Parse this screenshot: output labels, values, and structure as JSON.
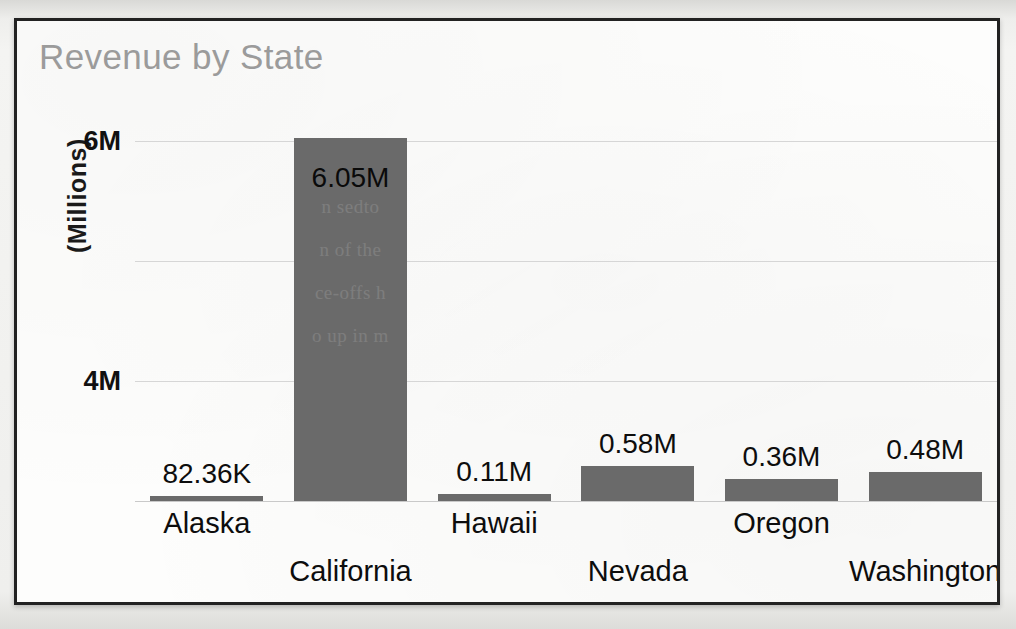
{
  "chart_data": {
    "type": "bar",
    "title": "Revenue by State",
    "xlabel": "",
    "ylabel": "(Millions)",
    "categories": [
      "Alaska",
      "California",
      "Hawaii",
      "Nevada",
      "Oregon",
      "Washington"
    ],
    "values": [
      0.08236,
      6.05,
      0.11,
      0.58,
      0.36,
      0.48
    ],
    "data_labels": [
      "82.36K",
      "6.05M",
      "0.11M",
      "0.58M",
      "0.36M",
      "0.48M"
    ],
    "ylim": [
      0,
      6
    ],
    "ytick_values": [
      0,
      2,
      4,
      6
    ],
    "ytick_labels": [
      "0M",
      "2M",
      "4M",
      "6M"
    ],
    "grid": true,
    "legend": "none",
    "series": [
      {
        "name": "Revenue",
        "values": [
          0.08236,
          6.05,
          0.11,
          0.58,
          0.36,
          0.48
        ]
      }
    ],
    "colors": {
      "bar": "#6a6a6a",
      "title": "#9b9b9b",
      "gridline": "#d6d6d6",
      "axis_text": "#111111",
      "frame_border": "#222222",
      "plot_background": "#fdfdfc"
    },
    "label_rows": [
      0,
      1,
      0,
      1,
      0,
      1
    ],
    "annotations": {
      "bleed_through_lines": [
        "n sedto",
        "n of the",
        "ce-offs h",
        "o up in m"
      ]
    }
  }
}
